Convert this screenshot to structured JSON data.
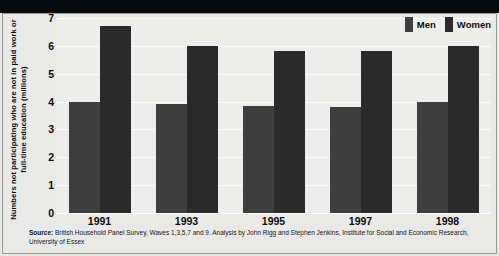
{
  "chart_data": {
    "type": "bar",
    "title": "",
    "xlabel": "",
    "ylabel": "Numbers not participating who are not in paid work or full-time education (millions)",
    "categories": [
      "1991",
      "1993",
      "1995",
      "1997",
      "1998"
    ],
    "series": [
      {
        "name": "Men",
        "color": "#3e3e3e",
        "values": [
          4.0,
          3.9,
          3.85,
          3.8,
          4.0
        ]
      },
      {
        "name": "Women",
        "color": "#2a2a2a",
        "values": [
          6.7,
          6.0,
          5.8,
          5.8,
          6.0
        ]
      }
    ],
    "ylim": [
      0,
      7
    ],
    "yticks": [
      0,
      1,
      2,
      3,
      4,
      5,
      6,
      7
    ],
    "ytick_labels": [
      "0",
      "1",
      "2",
      "3",
      "4",
      "5",
      "6",
      "7"
    ],
    "grid": true,
    "legend_position": "top-right"
  },
  "legend": {
    "items": [
      {
        "label": "Men",
        "color": "#3e3e3e"
      },
      {
        "label": "Women",
        "color": "#2a2a2a"
      }
    ]
  },
  "source": {
    "prefix": "Source:",
    "text": " British Household Panel Survey, Waves 1,3,5,7 and 9. Analysis by John Rigg and Stephen Jenkins, Institute for Social and Economic Research, University of Essex"
  }
}
